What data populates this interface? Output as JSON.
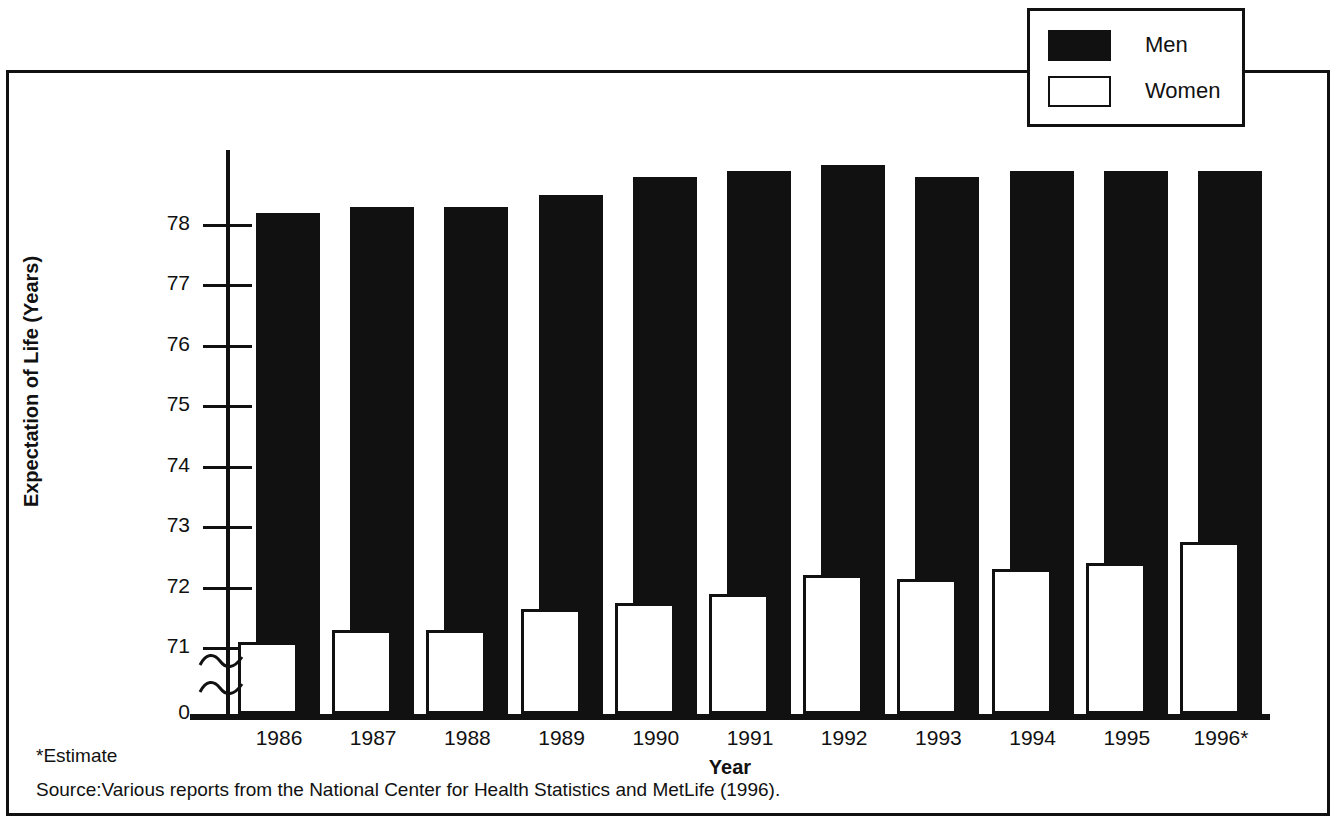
{
  "figure": {
    "legend": {
      "items": [
        {
          "label": "Men",
          "style": "filled-black"
        },
        {
          "label": "Women",
          "style": "outlined-white"
        }
      ]
    },
    "footnotes": {
      "estimate": "*Estimate",
      "source": "Source:Various reports from the National Center for Health Statistics and MetLife (1996)."
    }
  },
  "chart_data": {
    "type": "bar",
    "title": "",
    "xlabel": "Year",
    "ylabel": "Expectation of Life (Years)",
    "categories": [
      "1986",
      "1987",
      "1988",
      "1989",
      "1990",
      "1991",
      "1992",
      "1993",
      "1994",
      "1995",
      "1996*"
    ],
    "series": [
      {
        "name": "Men",
        "color": "#111111",
        "values": [
          78.2,
          78.3,
          78.3,
          78.5,
          78.8,
          78.9,
          79.0,
          78.8,
          78.9,
          78.9,
          78.9
        ]
      },
      {
        "name": "Women",
        "color": "#ffffff",
        "values": [
          71.1,
          71.3,
          71.3,
          71.65,
          71.75,
          71.9,
          72.2,
          72.15,
          72.3,
          72.4,
          72.75
        ]
      }
    ],
    "ytick_labels": [
      "78",
      "77",
      "76",
      "75",
      "74",
      "73",
      "72",
      "71",
      "0"
    ],
    "ytick_values": [
      78,
      77,
      76,
      75,
      74,
      73,
      72,
      71,
      0
    ],
    "ylim": [
      70.8,
      79.3
    ],
    "axis_break": true,
    "axis_break_note": "y-axis broken between 0 and 71",
    "grid": false,
    "legend_position": "top-right"
  }
}
